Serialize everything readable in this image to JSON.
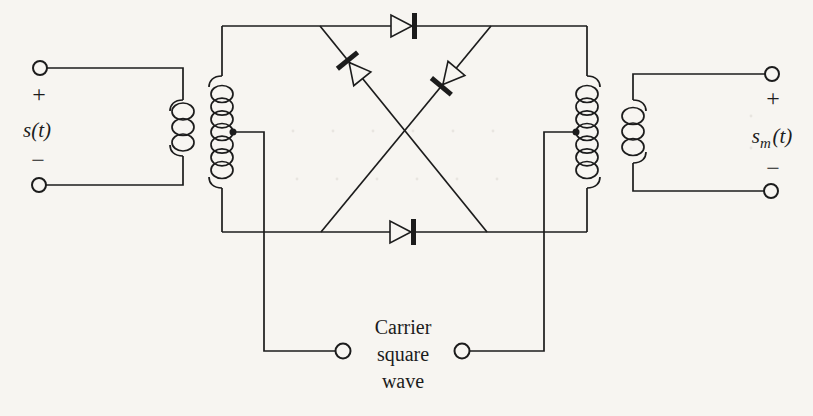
{
  "colors": {
    "ink": "#1c1c1c",
    "paper": "#f7f5f1"
  },
  "labels": {
    "input": {
      "plus": "+",
      "signal": "s(t)",
      "minus": "−"
    },
    "output": {
      "plus": "+",
      "signal_base": "s",
      "signal_sub": "m",
      "signal_rest": "(t)",
      "minus": "−"
    },
    "carrier": [
      "Carrier",
      "square",
      "wave"
    ]
  },
  "icons": {
    "input_terminal_top": "circle-terminal-icon",
    "input_terminal_bottom": "circle-terminal-icon",
    "output_terminal_top": "circle-terminal-icon",
    "output_terminal_bottom": "circle-terminal-icon",
    "carrier_terminal_left": "circle-terminal-icon",
    "carrier_terminal_right": "circle-terminal-icon",
    "input_transformer": "transformer-coils-icon",
    "output_transformer": "transformer-coils-icon",
    "diode_top": "diode-right-icon",
    "diode_bottom": "diode-right-icon",
    "diode_cross_left": "diode-up-left-icon",
    "diode_cross_right": "diode-down-left-icon",
    "center_tap_left": "junction-dot-icon",
    "center_tap_right": "junction-dot-icon"
  }
}
